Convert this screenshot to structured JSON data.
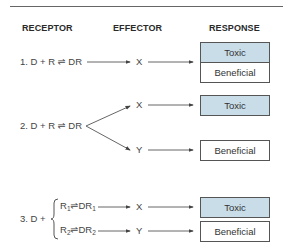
{
  "headers": {
    "receptor": "RECEPTOR",
    "effector": "EFFECTOR",
    "response": "RESPONSE"
  },
  "rows": [
    {
      "number": "1.",
      "reaction": "D + R ⇌ DR",
      "effectors": [
        "X"
      ],
      "responses": [
        "Toxic",
        "Beneficial"
      ]
    },
    {
      "number": "2.",
      "reaction": "D + R ⇌ DR",
      "effectors": [
        "X",
        "Y"
      ],
      "responses": [
        "Toxic",
        "Beneficial"
      ]
    },
    {
      "number": "3.",
      "prefix": "D +",
      "reactions": [
        {
          "r": "R",
          "sub": "1",
          "dr": "DR",
          "drsub": "1",
          "eq": "⇌"
        },
        {
          "r": "R",
          "sub": "2",
          "dr": "DR",
          "drsub": "2",
          "eq": "⇌"
        }
      ],
      "effectors": [
        "X",
        "Y"
      ],
      "responses": [
        "Toxic",
        "Beneficial"
      ]
    }
  ],
  "colors": {
    "toxic_fill": "#c9dde8",
    "beneficial_fill": "#ffffff",
    "line": "#555555"
  }
}
